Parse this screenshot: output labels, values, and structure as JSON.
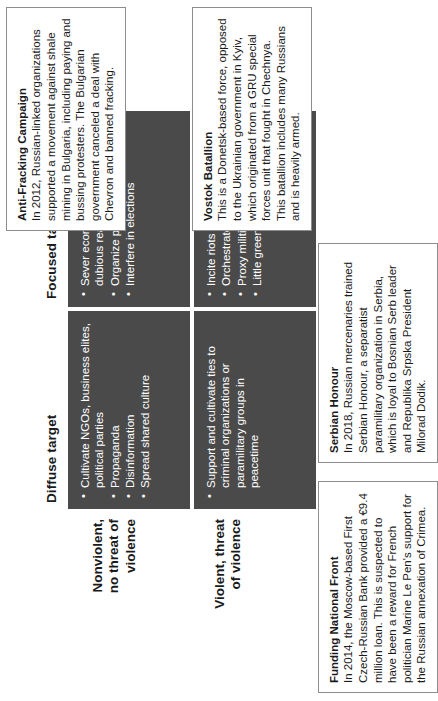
{
  "diagram": {
    "type": "2x2-matrix",
    "column_headers": [
      {
        "id": "diffuse",
        "label": "Diffuse target"
      },
      {
        "id": "focused",
        "label": "Focused target"
      }
    ],
    "row_headers": [
      {
        "id": "nonviolent",
        "line1": "Nonviolent,",
        "line2": "no threat of",
        "line3": "violence"
      },
      {
        "id": "violent",
        "line1": "Violent, threat",
        "line2": "of violence",
        "line3": ""
      }
    ],
    "cells": {
      "nonviolent_diffuse": {
        "bullets": [
          "Cultivate NGOs, business elites, political parties",
          "Propaganda",
          "Disinformation",
          "Spread shared culture"
        ]
      },
      "nonviolent_focused": {
        "bullets": [
          "Sever economic ties for dubious reasons",
          "Organize protests",
          "Interfere in elections"
        ]
      },
      "violent_diffuse": {
        "bullets": [
          "Support and cultivate ties to criminal organizations or paramilitary groups in peacetime"
        ]
      },
      "violent_focused": {
        "bullets": [
          "Incite riots",
          "Orchestrate coup",
          "Proxy militias",
          "Little green men"
        ]
      }
    },
    "callouts": {
      "funding_national_front": {
        "title": "Funding National Front",
        "body": "In 2014, the Moscow-based First Czech-Russian Bank provided a €9.4 million loan. This is suspected to have been a reward for French politician Marine Le Pen's support for the Russian annexation of Crimea."
      },
      "serbian_honour": {
        "title": "Serbian Honour",
        "body": "In 2018, Russian mercenaries trained Serbian Honour, a separatist paramilitary organization in Serbia, which is loyal to Bosnian Serb leader and Republika Srpska President Milorad Dodik."
      },
      "anti_fracking_campaign": {
        "title": "Anti-Fracking Campaign",
        "body": "In 2012, Russian-linked organizations supported a movement against shale mining in Bulgaria, including paying and bussing protesters. The Bulgarian government canceled a deal with Chevron and banned fracking."
      },
      "vostok_batallion": {
        "title": "Vostok Batallion",
        "body": "This is a Donetsk-based force, opposed to the Ukrainian government in Kyiv, which originated from a GRU special forces unit that fought in Chechnya. This batallion includes many Russians and is heavily armed."
      }
    },
    "colors": {
      "cell_fill": "#4a4a4a",
      "cell_text": "#ffffff",
      "callout_border": "#8d8d8d",
      "page_background": "#ffffff",
      "header_text": "#1a1a1a"
    }
  }
}
